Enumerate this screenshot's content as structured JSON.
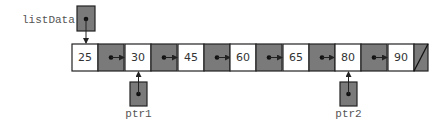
{
  "diagram": {
    "type": "linked-list",
    "head_pointer": {
      "label": "listData",
      "points_to": 0
    },
    "nodes": [
      {
        "value": "25",
        "next": 1
      },
      {
        "value": "30",
        "next": 2
      },
      {
        "value": "45",
        "next": 3
      },
      {
        "value": "60",
        "next": 4
      },
      {
        "value": "65",
        "next": 5
      },
      {
        "value": "80",
        "next": 6
      },
      {
        "value": "90",
        "next": null
      }
    ],
    "external_pointers": [
      {
        "label": "ptr1",
        "points_to": 1
      },
      {
        "label": "ptr2",
        "points_to": 5
      }
    ],
    "colors": {
      "link_fill": "#7a7a7a",
      "data_fill": "#ffffff",
      "stroke": "#222222"
    }
  }
}
